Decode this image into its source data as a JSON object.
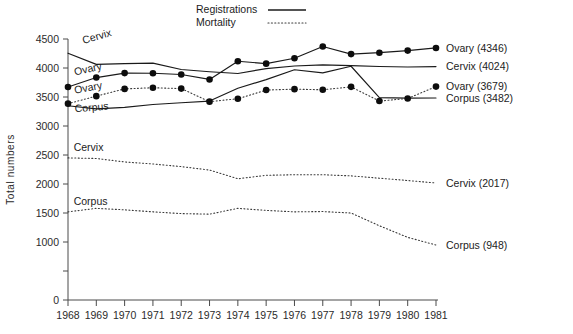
{
  "chart_data": {
    "type": "line",
    "title": "",
    "xlabel": "",
    "ylabel": "Total numbers",
    "x": [
      1968,
      1969,
      1970,
      1971,
      1972,
      1973,
      1974,
      1975,
      1976,
      1977,
      1978,
      1979,
      1980,
      1981
    ],
    "xlim": [
      1968,
      1981
    ],
    "ylim": [
      0,
      4500
    ],
    "yticks": [
      0,
      500,
      1000,
      1500,
      2000,
      2500,
      3000,
      3500,
      4000,
      4500
    ],
    "ytick_labels": [
      "0",
      "",
      "1000",
      "1500",
      "2000",
      "2500",
      "3000",
      "3500",
      "4000",
      "4500"
    ],
    "xtick_labels": [
      "1968",
      "1969",
      "1970",
      "1971",
      "1972",
      "1973",
      "1974",
      "1975",
      "1976",
      "1977",
      "1978",
      "1979",
      "1980",
      "1981"
    ],
    "grid": false,
    "legend_position": "top-center",
    "legend": [
      {
        "label": "Registrations",
        "style": "solid"
      },
      {
        "label": "Mortality",
        "style": "dotted"
      }
    ],
    "series": [
      {
        "name": "Ovary registrations",
        "style": "solid",
        "markers": true,
        "inline_label": "Ovary",
        "end_label": "Ovary (4346)",
        "final_value": 4346,
        "values": [
          3672,
          3835,
          3912,
          3910,
          3888,
          3803,
          4117,
          4075,
          4168,
          4371,
          4240,
          4264,
          4300,
          4346
        ]
      },
      {
        "name": "Cervix registrations",
        "style": "solid",
        "markers": false,
        "inline_label": "Cervix",
        "end_label": "Cervix (4024)",
        "final_value": 4024,
        "values": [
          4255,
          4063,
          4075,
          4085,
          3975,
          3935,
          3905,
          3990,
          4035,
          4055,
          4040,
          4025,
          4018,
          4024
        ]
      },
      {
        "name": "Corpus registrations",
        "style": "solid",
        "markers": false,
        "inline_label": "Corpus",
        "end_label": "Corpus (3482)",
        "final_value": 3482,
        "values": [
          3350,
          3295,
          3320,
          3370,
          3400,
          3430,
          3650,
          3800,
          3970,
          3915,
          4030,
          3490,
          3480,
          3482
        ]
      },
      {
        "name": "Ovary mortality",
        "style": "dotted",
        "markers": true,
        "inline_label": "Ovary",
        "end_label": "Ovary (3679)",
        "final_value": 3679,
        "values": [
          3385,
          3515,
          3640,
          3660,
          3645,
          3420,
          3470,
          3620,
          3635,
          3625,
          3675,
          3430,
          3475,
          3679
        ]
      },
      {
        "name": "Cervix mortality",
        "style": "dotted",
        "markers": false,
        "inline_label": "Cervix",
        "end_label": "Cervix (2017)",
        "final_value": 2017,
        "values": [
          2450,
          2440,
          2380,
          2345,
          2300,
          2240,
          2090,
          2150,
          2160,
          2160,
          2140,
          2100,
          2060,
          2017
        ]
      },
      {
        "name": "Corpus mortality",
        "style": "dotted",
        "markers": false,
        "inline_label": "Corpus",
        "end_label": "Corpus (948)",
        "final_value": 948,
        "values": [
          1520,
          1580,
          1555,
          1520,
          1490,
          1480,
          1580,
          1545,
          1520,
          1525,
          1500,
          1280,
          1080,
          948
        ]
      }
    ],
    "inline_annotations": [
      {
        "text": "Cervix",
        "x": 1968.55,
        "y": 4415,
        "rotate": -16
      },
      {
        "text": "Ovary",
        "x": 1968.25,
        "y": 3870,
        "rotate": -13
      },
      {
        "text": "Ovary",
        "x": 1968.25,
        "y": 3555,
        "rotate": -11
      },
      {
        "text": "Corpus",
        "x": 1968.25,
        "y": 3235,
        "rotate": -5
      },
      {
        "text": "Cervix",
        "x": 1968.2,
        "y": 2565,
        "rotate": 0
      },
      {
        "text": "Corpus",
        "x": 1968.2,
        "y": 1640,
        "rotate": 0
      }
    ]
  }
}
